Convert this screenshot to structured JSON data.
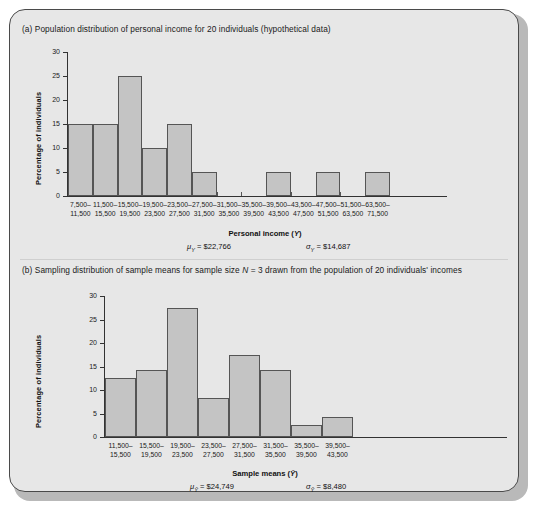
{
  "figure": {
    "panel_a": {
      "label": "(a)",
      "title": "Population distribution of personal income for 20 individuals (hypothetical data)",
      "ylabel": "Percentage of individuals",
      "xlabel_main": "Personal income (",
      "xlabel_var": "Y",
      "xlabel_close": ")",
      "mean_symbol": "μ",
      "mean_sub": "Y",
      "mean_value": "= $22,766",
      "sd_symbol": "σ",
      "sd_sub": "Y",
      "sd_value": "= $14,687"
    },
    "panel_b": {
      "label": "(b)",
      "title_part1": "Sampling distribution of sample means for sample size ",
      "title_var": "N",
      "title_part2": " = 3 drawn from the population of 20 individuals' incomes",
      "ylabel": "Percentage of individuals",
      "xlabel_main": "Sample means (",
      "xlabel_var": "Ȳ",
      "xlabel_close": ")",
      "mean_symbol": "μ",
      "mean_sub": "Ȳ",
      "mean_value": "= $24,749",
      "sd_symbol": "σ",
      "sd_sub": "Ȳ",
      "sd_value": "= $8,480"
    }
  },
  "chart_data": [
    {
      "type": "bar",
      "id": "panel-a-histogram",
      "title": "(a) Population distribution of personal income for 20 individuals (hypothetical data)",
      "xlabel": "Personal income (Y)",
      "ylabel": "Percentage of individuals",
      "ylim": [
        0,
        30
      ],
      "yticks": [
        0,
        5,
        10,
        15,
        20,
        25,
        30
      ],
      "grid": false,
      "legend": "none",
      "categories": [
        "7,500–\n11,500",
        "11,500–\n15,500",
        "15,500–\n19,500",
        "19,500–\n23,500",
        "23,500–\n27,500",
        "27,500–\n31,500",
        "31,500–\n35,500",
        "35,500–\n39,500",
        "39,500–\n43,500",
        "43,500–\n47,500",
        "47,500–\n51,500",
        "51,500–\n63,500",
        "63,500–\n71,500"
      ],
      "category_lines": [
        [
          "7,500–",
          "11,500"
        ],
        [
          "11,500–",
          "15,500"
        ],
        [
          "15,500–",
          "19,500"
        ],
        [
          "19,500–",
          "23,500"
        ],
        [
          "23,500–",
          "27,500"
        ],
        [
          "27,500–",
          "31,500"
        ],
        [
          "31,500–",
          "35,500"
        ],
        [
          "35,500–",
          "39,500"
        ],
        [
          "39,500–",
          "43,500"
        ],
        [
          "43,500–",
          "47,500"
        ],
        [
          "47,500–",
          "51,500"
        ],
        [
          "51,500–",
          "63,500"
        ],
        [
          "63,500–",
          "71,500"
        ]
      ],
      "values": [
        15,
        15,
        25,
        10,
        15,
        5,
        0,
        0,
        5,
        0,
        5,
        0,
        5
      ],
      "annotations": [
        "μY = $22,766",
        "σY = $14,687"
      ]
    },
    {
      "type": "bar",
      "id": "panel-b-histogram",
      "title": "(b) Sampling distribution of sample means for sample size N = 3 drawn from the population of 20 individuals' incomes",
      "xlabel": "Sample means (Ȳ)",
      "ylabel": "Percentage of individuals",
      "ylim": [
        0,
        30
      ],
      "yticks": [
        0,
        5,
        10,
        15,
        20,
        25,
        30
      ],
      "grid": false,
      "legend": "none",
      "categories": [
        "11,500–\n15,500",
        "15,500–\n19,500",
        "19,500–\n23,500",
        "23,500–\n27,500",
        "27,500–\n31,500",
        "31,500–\n35,500",
        "35,500–\n39,500",
        "39,500–\n43,500"
      ],
      "category_lines": [
        [
          "11,500–",
          "15,500"
        ],
        [
          "15,500–",
          "19,500"
        ],
        [
          "19,500–",
          "23,500"
        ],
        [
          "23,500–",
          "27,500"
        ],
        [
          "27,500–",
          "31,500"
        ],
        [
          "31,500–",
          "35,500"
        ],
        [
          "35,500–",
          "39,500"
        ],
        [
          "39,500–",
          "43,500"
        ]
      ],
      "values": [
        12.5,
        14.2,
        27.5,
        8.3,
        17.5,
        14.2,
        2.5,
        4.2
      ],
      "annotations": [
        "μȲ = $24,749",
        "σȲ = $8,480"
      ]
    }
  ]
}
